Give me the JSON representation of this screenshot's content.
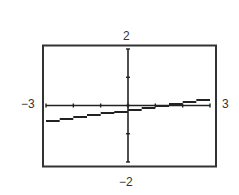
{
  "chart_data": {
    "type": "line",
    "title": "",
    "xlabel": "",
    "ylabel": "",
    "xlim": [
      -3,
      3
    ],
    "ylim": [
      -2,
      2
    ],
    "window_labels": {
      "xmin": "−3",
      "xmax": "3",
      "ymin": "−2",
      "ymax": "2"
    },
    "x_ticks": [
      -3,
      -2,
      -1,
      0,
      1,
      2,
      3
    ],
    "y_ticks": [
      -2,
      -1,
      0,
      1,
      2
    ],
    "grid": false,
    "legend": null,
    "series": [
      {
        "name": "line",
        "x": [
          -3,
          -2,
          -1,
          0,
          1,
          2,
          3
        ],
        "y": [
          -0.57,
          -0.44,
          -0.31,
          -0.18,
          -0.05,
          0.08,
          0.21
        ]
      }
    ]
  },
  "labels": {
    "ymax": "2",
    "ymin": "−2",
    "xmin": "−3",
    "xmax": "3"
  }
}
